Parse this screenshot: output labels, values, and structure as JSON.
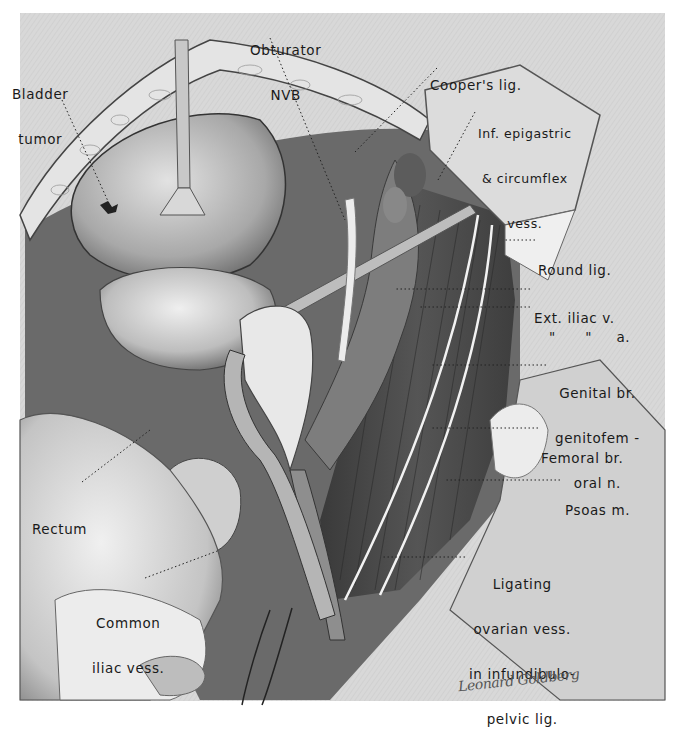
{
  "figure": {
    "colors": {
      "paper": "#d9d9d9",
      "tissue_light": "#cfcfcf",
      "tissue_mid": "#9a9a9a",
      "muscle_dark": "#4a4a4a",
      "label_text": "#1a1a1a"
    }
  },
  "labels": {
    "bladder_tumor": [
      "Bladder",
      "tumor"
    ],
    "obturator_nvb": [
      "Obturator",
      "NVB"
    ],
    "coopers_lig": [
      "Cooper's lig."
    ],
    "inf_epigastric": [
      "Inf. epigastric",
      "& circumflex",
      "vess."
    ],
    "round_lig": [
      "Round lig."
    ],
    "ext_iliac_v": [
      "Ext. iliac v."
    ],
    "ext_iliac_a": [
      "\"      \"     a."
    ],
    "genital_br": [
      "Genital br.",
      "genitofem -",
      "oral n."
    ],
    "femoral_br": [
      "Femoral br."
    ],
    "psoas_m": [
      "Psoas m."
    ],
    "rectum": [
      "Rectum"
    ],
    "common_iliac": [
      "Common",
      "iliac vess."
    ],
    "ligating": [
      "Ligating",
      "ovarian vess.",
      "in infundibulo-",
      "pelvic lig."
    ]
  },
  "signature": "Leonard Goldberg"
}
